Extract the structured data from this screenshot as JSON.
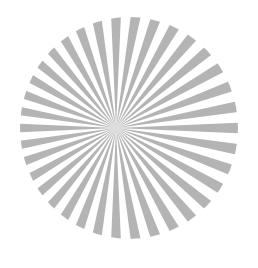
{
  "image": {
    "subject": "Siemens star test pattern",
    "background_color": "#ffffff",
    "spoke_color": "#b4b4b4",
    "center": {
      "x": 116,
      "y": 128
    },
    "clip_ellipse": {
      "cx": 129,
      "cy": 138,
      "rx": 109,
      "ry": 111
    },
    "outer_radius": 140,
    "spoke_count": 36,
    "spoke_angle_deg": 5,
    "start_angle_deg": -2.5
  }
}
